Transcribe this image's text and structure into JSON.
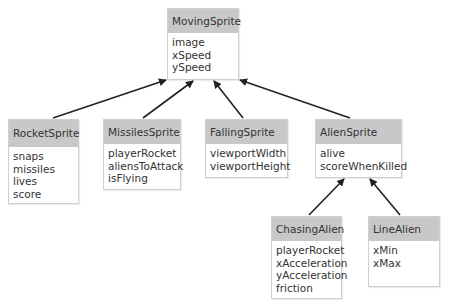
{
  "diagram": {
    "type": "class-hierarchy",
    "colors": {
      "header": "#c8c8c8",
      "border": "#cfcfcf",
      "text": "#333333",
      "arrow": "#222222"
    },
    "classes": [
      {
        "id": "moving",
        "name": "MovingSprite",
        "fields": [
          "image",
          "xSpeed",
          "ySpeed"
        ]
      },
      {
        "id": "rocket",
        "name": "RocketSprite",
        "fields": [
          "snaps",
          "missiles",
          "lives",
          "score"
        ]
      },
      {
        "id": "missiles",
        "name": "MissilesSprite",
        "fields": [
          "playerRocket",
          "aliensToAttack",
          "isFlying"
        ]
      },
      {
        "id": "falling",
        "name": "FallingSprite",
        "fields": [
          "viewportWidth",
          "viewportHeight"
        ]
      },
      {
        "id": "alien",
        "name": "AlienSprite",
        "fields": [
          "alive",
          "scoreWhenKilled"
        ]
      },
      {
        "id": "chasing",
        "name": "ChasingAlien",
        "fields": [
          "playerRocket",
          "xAcceleration",
          "yAcceleration",
          "friction"
        ]
      },
      {
        "id": "line",
        "name": "LineAlien",
        "fields": [
          "xMin",
          "xMax"
        ]
      }
    ],
    "inheritance": [
      {
        "child": "RocketSprite",
        "parent": "MovingSprite"
      },
      {
        "child": "MissilesSprite",
        "parent": "MovingSprite"
      },
      {
        "child": "FallingSprite",
        "parent": "MovingSprite"
      },
      {
        "child": "AlienSprite",
        "parent": "MovingSprite"
      },
      {
        "child": "ChasingAlien",
        "parent": "AlienSprite"
      },
      {
        "child": "LineAlien",
        "parent": "AlienSprite"
      }
    ]
  }
}
